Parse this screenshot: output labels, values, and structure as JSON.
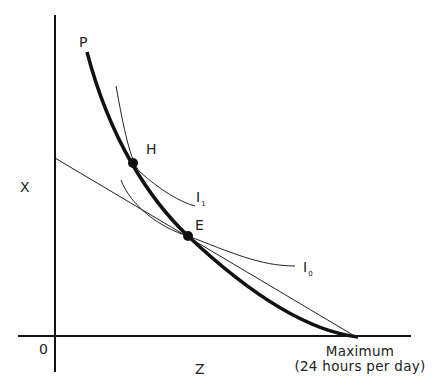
{
  "diagram": {
    "axes": {
      "y_label": "X",
      "x_label": "Z",
      "origin_label": "0",
      "x_max_label_line1": "Maximum",
      "x_max_label_line2": "(24 hours per day)"
    },
    "curves": {
      "frontier_label": "P",
      "indifference_high_label": "I",
      "indifference_high_sub": "1",
      "indifference_low_label": "I",
      "indifference_low_sub": "0"
    },
    "points": {
      "high_point_label": "H",
      "equilibrium_label": "E"
    },
    "colors": {
      "line": "#111111",
      "background": "#ffffff"
    }
  }
}
